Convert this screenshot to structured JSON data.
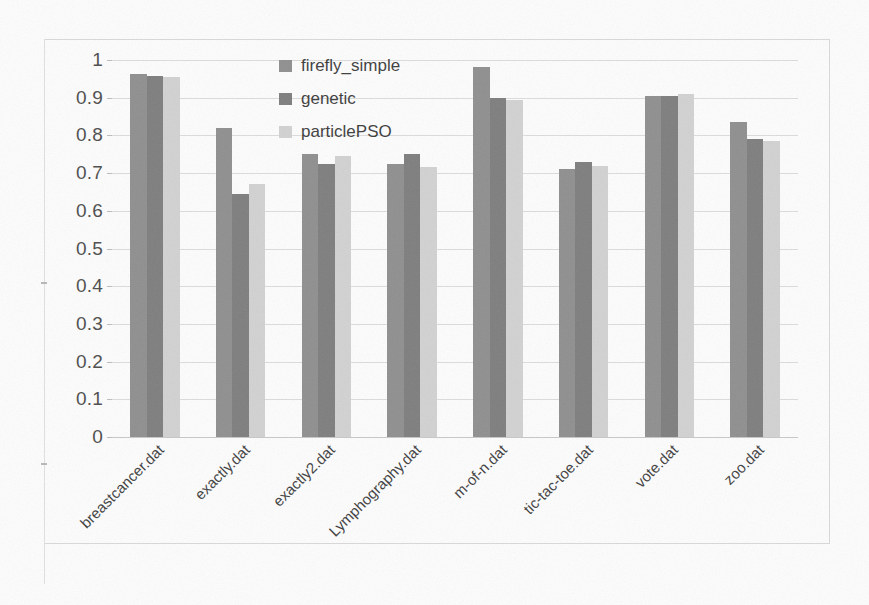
{
  "chart_data": {
    "type": "bar",
    "title": "",
    "subtitle": "",
    "xlabel": "",
    "ylabel": "",
    "ylim": [
      0,
      1
    ],
    "ytick_labels": [
      "1",
      "0.9",
      "0.8",
      "0.7",
      "0.6",
      "0.5",
      "0.4",
      "0.3",
      "0.2",
      "0.1",
      "0"
    ],
    "ytick_values": [
      1,
      0.9,
      0.8,
      0.7,
      0.6,
      0.5,
      0.4,
      0.3,
      0.2,
      0.1,
      0
    ],
    "grid": true,
    "legend_position": "top-center-inside",
    "categories": [
      "breastcancer.dat",
      "exactly.dat",
      "exactly2.dat",
      "Lymphography.dat",
      "m-of-n.dat",
      "tic-tac-toe.dat",
      "vote.dat",
      "zoo.dat"
    ],
    "series": [
      {
        "name": "firefly_simple",
        "color": "#8f8f8f",
        "values": [
          0.962,
          0.82,
          0.75,
          0.725,
          0.982,
          0.71,
          0.905,
          0.835
        ]
      },
      {
        "name": "genetic",
        "color": "#7e7e7e",
        "values": [
          0.957,
          0.645,
          0.723,
          0.75,
          0.9,
          0.73,
          0.905,
          0.79
        ]
      },
      {
        "name": "particlePSO",
        "color": "#d2d2d2",
        "values": [
          0.955,
          0.67,
          0.745,
          0.715,
          0.895,
          0.72,
          0.91,
          0.785
        ]
      }
    ]
  },
  "legend": {
    "items": [
      {
        "label": "firefly_simple",
        "color": "#8f8f8f"
      },
      {
        "label": "genetic",
        "color": "#7e7e7e"
      },
      {
        "label": "particlePSO",
        "color": "#d2d2d2"
      }
    ]
  }
}
